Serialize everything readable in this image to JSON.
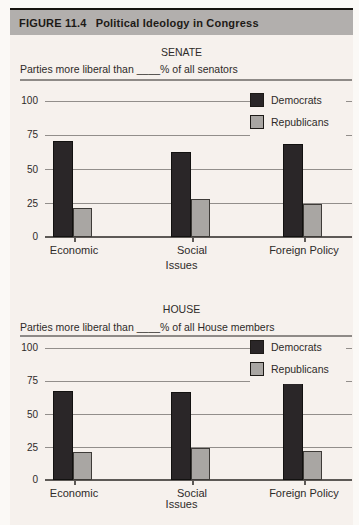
{
  "figure": {
    "label": "FIGURE 11.4",
    "title": "Political Ideology in Congress"
  },
  "chart_data": [
    {
      "type": "bar",
      "title": "SENATE",
      "subtitle": "Parties more liberal than ____% of all senators",
      "xlabel": "Issues",
      "categories": [
        "Economic",
        "Social",
        "Foreign Policy"
      ],
      "series": [
        {
          "name": "Democrats",
          "color": "#2a2628",
          "values": [
            70,
            62,
            68
          ]
        },
        {
          "name": "Republicans",
          "color": "#a9a6a3",
          "values": [
            21,
            28,
            24
          ]
        }
      ],
      "ylim": [
        0,
        100
      ],
      "yticks": [
        0,
        25,
        50,
        75,
        100
      ],
      "grid": true,
      "legend_position": "top-right"
    },
    {
      "type": "bar",
      "title": "HOUSE",
      "subtitle": "Parties more liberal than ____% of all House members",
      "xlabel": "Issues",
      "categories": [
        "Economic",
        "Social",
        "Foreign Policy"
      ],
      "series": [
        {
          "name": "Democrats",
          "color": "#2a2628",
          "values": [
            67,
            66,
            73
          ]
        },
        {
          "name": "Republicans",
          "color": "#a9a6a3",
          "values": [
            21,
            24,
            22
          ]
        }
      ],
      "ylim": [
        0,
        100
      ],
      "yticks": [
        0,
        25,
        50,
        75,
        100
      ],
      "grid": true,
      "legend_position": "top-right"
    }
  ]
}
